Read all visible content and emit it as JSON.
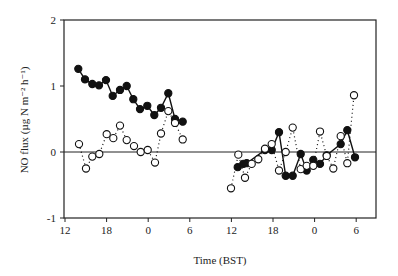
{
  "chart_data": {
    "type": "scatter",
    "title": "",
    "xlabel": "Time (BST)",
    "ylabel": "NO flux (µg N m⁻² h⁻¹)",
    "ylim": [
      -1,
      2
    ],
    "yticks": [
      "2",
      "1",
      "0",
      "-1"
    ],
    "xticks": [
      "12",
      "18",
      "0",
      "6",
      "12",
      "18",
      "0",
      "6"
    ],
    "zero_line": true,
    "series": [
      {
        "name": "filled",
        "marker": "filled-circle",
        "line": "solid",
        "segments": [
          {
            "x": [
              78.3,
              85,
              92.3,
              99,
              106,
              112.7,
              120,
              126.7,
              133.3,
              140,
              147.3,
              154.3,
              161,
              168.3,
              175,
              182.7
            ],
            "values": [
              1.26,
              1.1,
              1.03,
              1.01,
              1.09,
              0.85,
              0.94,
              1.0,
              0.8,
              0.65,
              0.7,
              0.56,
              0.67,
              0.89,
              0.5,
              0.46
            ]
          },
          {
            "x": [
              237.7,
              243.3,
              246.7,
              265,
              271.7,
              279,
              285.7,
              292.7,
              300.7,
              306.7,
              313.3,
              320,
              326.7,
              340.7,
              347.3,
              355
            ],
            "values": [
              -0.23,
              -0.18,
              -0.17,
              0.03,
              0.03,
              0.3,
              -0.36,
              -0.36,
              -0.03,
              -0.28,
              -0.12,
              -0.18,
              -0.05,
              0.12,
              0.33,
              -0.08
            ]
          }
        ]
      },
      {
        "name": "open",
        "marker": "open-circle",
        "line": "dotted",
        "segments": [
          {
            "x": [
              79,
              86,
              92.3,
              99.3,
              106.7,
              113.3,
              120,
              126.7,
              134,
              140.7,
              147.7,
              155,
              161,
              168.3,
              175,
              182.7
            ],
            "values": [
              0.12,
              -0.25,
              -0.07,
              -0.03,
              0.27,
              0.21,
              0.4,
              0.18,
              0.09,
              0.0,
              0.03,
              -0.16,
              0.28,
              0.62,
              0.44,
              0.19
            ]
          },
          {
            "x": [
              231,
              238.3,
              245,
              251.7,
              258.3,
              265,
              271.7,
              279,
              285.7,
              292.7,
              300.7,
              306.7,
              313.3,
              320,
              326.7,
              333.3,
              340.7,
              347.3,
              354
            ],
            "values": [
              -0.55,
              -0.04,
              -0.39,
              -0.18,
              -0.11,
              0.05,
              0.12,
              -0.28,
              0.0,
              0.37,
              -0.26,
              -0.21,
              -0.21,
              0.31,
              -0.06,
              -0.25,
              0.24,
              -0.17,
              0.86
            ]
          }
        ]
      }
    ]
  }
}
